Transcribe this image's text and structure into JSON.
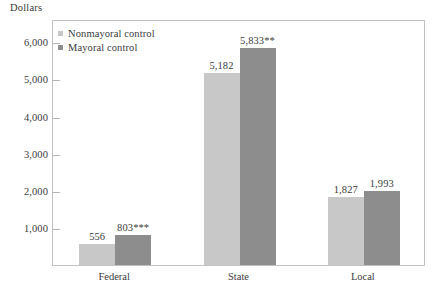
{
  "chart_data": {
    "type": "bar",
    "title": "",
    "subtitle": "",
    "xlabel": "",
    "ylabel": "Dollars",
    "categories": [
      "Federal",
      "State",
      "Local"
    ],
    "series": [
      {
        "name": "Nonmayoral control",
        "color": "#c8c8c8",
        "values": [
          556,
          5182,
          1827
        ],
        "labels": [
          "556",
          "5,182",
          "1,827"
        ]
      },
      {
        "name": "Mayoral control",
        "color": "#8d8d8d",
        "values": [
          803,
          5833,
          1993
        ],
        "labels": [
          "803***",
          "5,833**",
          "1,993"
        ]
      }
    ],
    "ylim": [
      0,
      6600
    ],
    "yticks": [
      1000,
      2000,
      3000,
      4000,
      5000,
      6000
    ],
    "ytick_labels": [
      "1,000",
      "2,000",
      "3,000",
      "4,000",
      "5,000",
      "6,000"
    ],
    "grid": false,
    "legend_position": "top-left",
    "annotations": [
      "*** on Mayoral control Federal value (803)",
      "** on Mayoral control State value (5,833)"
    ]
  },
  "legend": {
    "entries": [
      {
        "label": "Nonmayoral control"
      },
      {
        "label": "Mayoral control"
      }
    ]
  },
  "colors": {
    "light_bar": "#c8c8c8",
    "dark_bar": "#8d8d8d",
    "frame": "#c2c2c2",
    "text": "#3b3b3b"
  }
}
